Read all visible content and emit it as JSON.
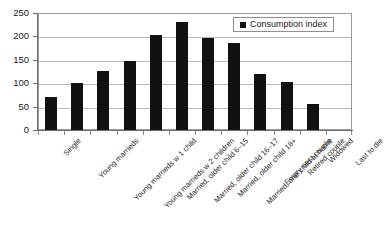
{
  "chart_data": {
    "type": "bar",
    "title": "",
    "xlabel": "",
    "ylabel": "",
    "ylim": [
      0,
      250
    ],
    "ytick_step": 50,
    "yticks": [
      "0",
      "50",
      "100",
      "150",
      "200",
      "250"
    ],
    "grid": true,
    "legend_position": "top-right",
    "bar_color": "#111111",
    "categories": [
      "Single",
      "Young marrieds",
      "Young marrieds w 1 child",
      "Young marrieds w 2 children",
      "Married, older child 6–15",
      "Married, older child 16–17",
      "Married, older child 18+",
      "Married, one child at home",
      "Empty nest couple",
      "Retired couple",
      "Widowed",
      "Last to die"
    ],
    "series": [
      {
        "name": "Consumption index",
        "values": [
          70,
          100,
          126,
          147,
          203,
          230,
          196,
          185,
          120,
          103,
          55,
          0
        ]
      }
    ]
  },
  "legend": {
    "entries": [
      {
        "label": "Consumption index",
        "color": "#111111",
        "marker": "square"
      }
    ]
  },
  "axes": {
    "y": {
      "ticks": [
        "250",
        "200",
        "150",
        "100",
        "50",
        "0"
      ],
      "min": 0,
      "max": 250
    }
  }
}
